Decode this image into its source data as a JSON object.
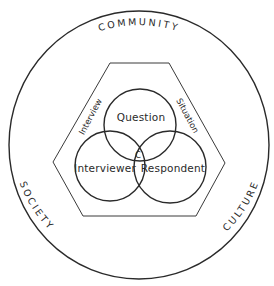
{
  "diagram": {
    "outer_ring": {
      "labels": {
        "top": "COMMUNITY",
        "left": "SOCIETY",
        "right": "CULTURE"
      }
    },
    "hexagon": {
      "labels": {
        "left": "Interview",
        "right": "Situation"
      }
    },
    "circles": [
      {
        "id": "question",
        "label": "Question"
      },
      {
        "id": "interviewer",
        "label": "Interviewer"
      },
      {
        "id": "respondent",
        "label": "Respondent"
      }
    ],
    "center_mark": "C"
  }
}
